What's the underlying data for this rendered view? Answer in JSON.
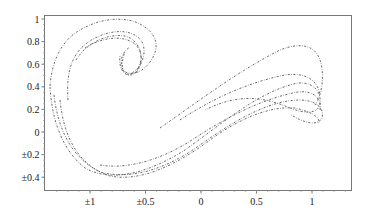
{
  "chart_data": {
    "type": "line",
    "title": "",
    "xlabel": "",
    "ylabel": "",
    "xlim": [
      -1.3,
      1.35
    ],
    "ylim": [
      -0.45,
      1.02
    ],
    "grid": false,
    "legend": null,
    "x_ticks": [
      {
        "value": -1,
        "label": "±1"
      },
      {
        "value": -0.5,
        "label": "±0.5"
      },
      {
        "value": 0,
        "label": "0"
      },
      {
        "value": 0.5,
        "label": "0.5"
      },
      {
        "value": 1,
        "label": "1"
      }
    ],
    "y_ticks": [
      {
        "value": 1,
        "label": "1"
      },
      {
        "value": 0.8,
        "label": "0.8"
      },
      {
        "value": 0.6,
        "label": "0.6"
      },
      {
        "value": 0.4,
        "label": "0.4"
      },
      {
        "value": 0.2,
        "label": "0.2"
      },
      {
        "value": 0,
        "label": "0"
      },
      {
        "value": -0.2,
        "label": "±0.2"
      },
      {
        "value": -0.4,
        "label": "±0.4"
      }
    ],
    "series": [
      {
        "name": "outer",
        "x": [
          -1.15,
          -1.1,
          -1.0,
          -0.85,
          -0.7,
          -0.55,
          -0.45,
          -0.42,
          -0.45,
          -0.55,
          -0.6
        ],
        "y": [
          0.4,
          0.65,
          0.82,
          0.93,
          0.97,
          0.93,
          0.82,
          0.72,
          0.62,
          0.55,
          0.52
        ]
      },
      {
        "name": "inner-hook",
        "x": [
          -1.05,
          -1.0,
          -0.9,
          -0.75,
          -0.62,
          -0.58,
          -0.6,
          -0.55,
          -0.5
        ],
        "y": [
          0.0,
          0.55,
          0.75,
          0.86,
          0.82,
          0.7,
          0.55,
          0.5,
          0.52
        ]
      },
      {
        "name": "band-1",
        "x": [
          -1.15,
          -1.1,
          -0.95,
          -0.7,
          -0.4,
          -0.1,
          0.2,
          0.5,
          0.8,
          1.05,
          1.12,
          1.1,
          0.95,
          0.7,
          0.45,
          0.15
        ],
        "y": [
          0.38,
          -0.1,
          -0.35,
          -0.42,
          -0.35,
          -0.15,
          0.1,
          0.35,
          0.5,
          0.45,
          0.3,
          0.25,
          0.35,
          0.45,
          0.45,
          0.3
        ]
      },
      {
        "name": "band-2",
        "x": [
          -1.1,
          -1.0,
          -0.8,
          -0.5,
          -0.2,
          0.1,
          0.4,
          0.7,
          0.95,
          1.1,
          1.15,
          1.1,
          0.95,
          0.7,
          0.4,
          0.1,
          -0.2
        ],
        "y": [
          0.3,
          -0.2,
          -0.38,
          -0.4,
          -0.27,
          -0.05,
          0.2,
          0.42,
          0.48,
          0.4,
          0.3,
          0.2,
          0.75,
          0.75,
          0.6,
          0.4,
          0.15
        ]
      },
      {
        "name": "band-3",
        "x": [
          -1.08,
          -0.95,
          -0.7,
          -0.4,
          -0.1,
          0.2,
          0.5,
          0.8,
          1.05,
          1.12
        ],
        "y": [
          0.35,
          -0.3,
          -0.44,
          -0.38,
          -0.18,
          0.05,
          0.3,
          0.45,
          0.4,
          0.25
        ]
      }
    ]
  }
}
